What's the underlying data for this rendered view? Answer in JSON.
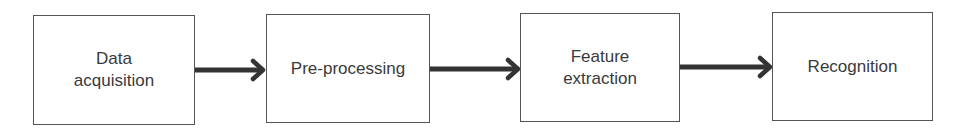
{
  "diagram": {
    "type": "flowchart",
    "direction": "left-to-right",
    "nodes": [
      {
        "id": "n1",
        "line1": "Data",
        "line2": "acquisition"
      },
      {
        "id": "n2",
        "line1": "Pre-processing",
        "line2": ""
      },
      {
        "id": "n3",
        "line1": "Feature",
        "line2": "extraction"
      },
      {
        "id": "n4",
        "line1": "Recognition",
        "line2": ""
      }
    ],
    "edges": [
      {
        "from": "n1",
        "to": "n2"
      },
      {
        "from": "n2",
        "to": "n3"
      },
      {
        "from": "n3",
        "to": "n4"
      }
    ],
    "colors": {
      "border": "#555555",
      "arrow": "#333333",
      "text": "#3a3a3a",
      "background": "#ffffff"
    }
  }
}
